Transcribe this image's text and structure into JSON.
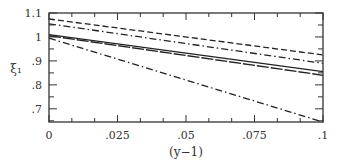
{
  "chart_data": {
    "type": "line",
    "title": "",
    "xlabel": "(y−1)",
    "ylabel": "ξ₁",
    "xlim": [
      0,
      0.1
    ],
    "ylim": [
      0.645,
      1.1
    ],
    "grid": false,
    "legend": null,
    "x_ticks": [
      {
        "value": 0,
        "label": "0"
      },
      {
        "value": 0.025,
        "label": ".025"
      },
      {
        "value": 0.05,
        "label": ".05"
      },
      {
        "value": 0.075,
        "label": ".075"
      },
      {
        "value": 0.1,
        "label": ".1"
      }
    ],
    "y_ticks": [
      {
        "value": 0.7,
        "label": ".7"
      },
      {
        "value": 0.8,
        "label": ".8"
      },
      {
        "value": 0.9,
        "label": ".9"
      },
      {
        "value": 1.0,
        "label": "1"
      },
      {
        "value": 1.1,
        "label": "1.1"
      }
    ],
    "series": [
      {
        "name": "dashed",
        "style": "dashed",
        "x": [
          0,
          0.1
        ],
        "values": [
          1.075,
          0.925
        ]
      },
      {
        "name": "dash-dot upper",
        "style": "dashdot",
        "x": [
          0,
          0.1
        ],
        "values": [
          1.055,
          0.89
        ]
      },
      {
        "name": "solid",
        "style": "solid",
        "x": [
          0,
          0.1
        ],
        "values": [
          1.01,
          0.855
        ]
      },
      {
        "name": "long-dash",
        "style": "longdash",
        "x": [
          0,
          0.1
        ],
        "values": [
          1.005,
          0.84
        ]
      },
      {
        "name": "dash-dot lower",
        "style": "dashdot",
        "x": [
          0,
          0.1
        ],
        "values": [
          0.995,
          0.645
        ]
      }
    ]
  }
}
